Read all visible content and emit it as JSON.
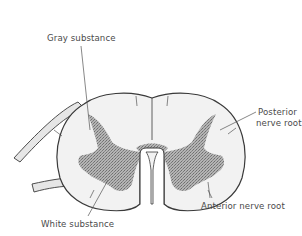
{
  "figure": {
    "labels": {
      "gray_substance": "Gray substance",
      "posterior_nerve_root_line1": "Posterior",
      "posterior_nerve_root_line2": "nerve root",
      "anterior_nerve_root": "Anterior nerve root",
      "white_substance": "White substance"
    },
    "colors": {
      "background": "#ffffff",
      "outline": "#3a3a3a",
      "white_matter_fill": "#f2f2f2",
      "gray_matter_fill": "#9a9a9a",
      "nerve_root_fill": "#e6e6e6",
      "label_text": "#4a4a4a",
      "leader_line": "#555555"
    }
  }
}
